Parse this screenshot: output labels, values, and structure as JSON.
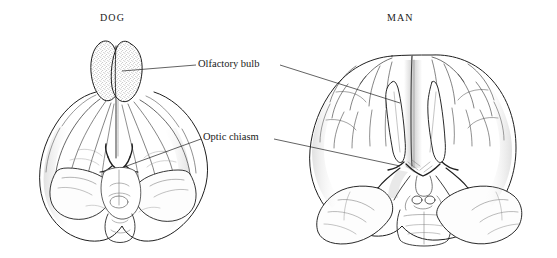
{
  "figure": {
    "background_color": "#ffffff",
    "ink_color": "#1a1a1a"
  },
  "headings": {
    "left": "DOG",
    "right": "MAN"
  },
  "callouts": [
    {
      "id": "olfactory-bulb",
      "text": "Olfactory  bulb",
      "leader_left": true,
      "leader_right": true
    },
    {
      "id": "optic-chiasm",
      "text": "Optic  chiasm",
      "leader_left": true,
      "leader_right": true
    }
  ],
  "specimens": [
    {
      "id": "dog-brain",
      "heading": "DOG",
      "structures": [
        "olfactory-bulb-left",
        "olfactory-bulb-right",
        "cerebral-hemisphere-left",
        "cerebral-hemisphere-right",
        "optic-chiasm",
        "temporal-lobe-left",
        "temporal-lobe-right",
        "cerebellum",
        "brainstem"
      ]
    },
    {
      "id": "human-brain",
      "heading": "MAN",
      "structures": [
        "frontal-lobe-left",
        "frontal-lobe-right",
        "olfactory-tract-left",
        "olfactory-tract-right",
        "optic-chiasm",
        "optic-nerve-left",
        "optic-nerve-right",
        "temporal-lobe-left",
        "temporal-lobe-right",
        "mammillary-bodies",
        "midbrain",
        "pons"
      ]
    }
  ]
}
